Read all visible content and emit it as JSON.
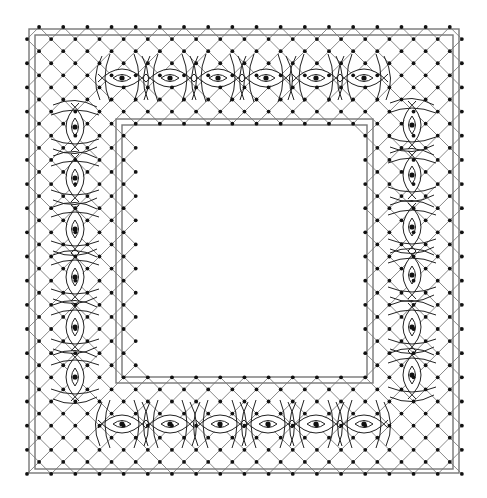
{
  "diagram": {
    "type": "lace-pricking",
    "canvas": {
      "width": 487,
      "height": 498,
      "background": "#ffffff"
    },
    "colors": {
      "frame": "#777777",
      "grid": "#6a6a6a",
      "pin": "#111111",
      "motif": "#222222"
    },
    "outer_frame": {
      "outer_rect": {
        "x": 29,
        "y": 29,
        "w": 430,
        "h": 444
      },
      "inner_rect": {
        "x": 35,
        "y": 35,
        "w": 418,
        "h": 434
      }
    },
    "inner_frame": {
      "outer_rect": {
        "x": 116,
        "y": 119,
        "w": 257,
        "h": 264
      },
      "inner_rect": {
        "x": 122,
        "y": 125,
        "w": 245,
        "h": 252
      }
    },
    "grid": {
      "origin": 27,
      "step": 12.08,
      "cols": 36,
      "rows": 37,
      "band": {
        "outer_min": 0,
        "outer_max_x": 36,
        "outer_max_y": 37,
        "hole_min_x": 9,
        "hole_max_x": 28,
        "hole_min_y": 8,
        "hole_max_y": 29
      },
      "pin_radius": 1.9,
      "pin_parity": "odd"
    },
    "motifs": {
      "top": [
        {
          "x": 122,
          "y": 78
        },
        {
          "x": 170,
          "y": 78
        },
        {
          "x": 218,
          "y": 78
        },
        {
          "x": 266,
          "y": 78
        },
        {
          "x": 316,
          "y": 78
        },
        {
          "x": 364,
          "y": 78
        }
      ],
      "bottom": [
        {
          "x": 122,
          "y": 424
        },
        {
          "x": 170,
          "y": 424
        },
        {
          "x": 220,
          "y": 424
        },
        {
          "x": 268,
          "y": 424
        },
        {
          "x": 316,
          "y": 424
        },
        {
          "x": 364,
          "y": 424
        }
      ],
      "left": [
        {
          "x": 75,
          "y": 127
        },
        {
          "x": 75,
          "y": 178
        },
        {
          "x": 75,
          "y": 229
        },
        {
          "x": 75,
          "y": 277
        },
        {
          "x": 75,
          "y": 327
        },
        {
          "x": 75,
          "y": 377
        }
      ],
      "right": [
        {
          "x": 412,
          "y": 125
        },
        {
          "x": 412,
          "y": 175
        },
        {
          "x": 412,
          "y": 227
        },
        {
          "x": 412,
          "y": 275
        },
        {
          "x": 412,
          "y": 327
        },
        {
          "x": 412,
          "y": 375
        }
      ]
    },
    "motif_label": "eye-motif"
  }
}
